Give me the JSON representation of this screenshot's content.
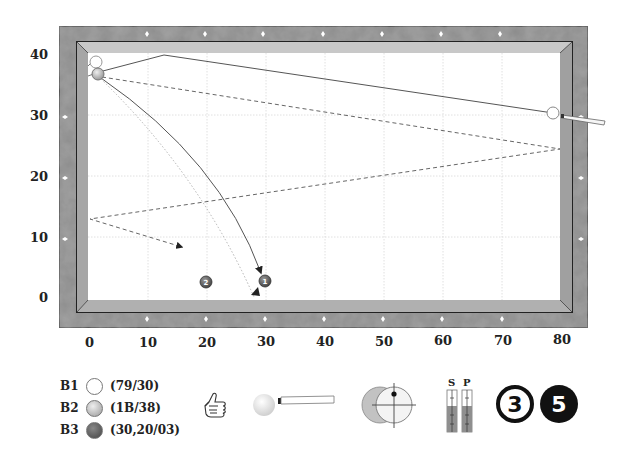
{
  "diagram": {
    "type": "billiards-carom-shot",
    "x_axis": {
      "ticks": [
        "0",
        "10",
        "20",
        "30",
        "40",
        "50",
        "60",
        "70",
        "80"
      ]
    },
    "y_axis": {
      "ticks": [
        "40",
        "30",
        "20",
        "10",
        "0"
      ]
    },
    "colors": {
      "rail": "#8a8a8a",
      "cushion": "#b9b9b9",
      "cloth": "#ffffff",
      "grid": "#d8d8d8",
      "line": "#555555"
    },
    "balls": [
      {
        "id": "B1",
        "label": "B1",
        "position": "(79/30)",
        "color": "#ffffff"
      },
      {
        "id": "B2",
        "label": "B2",
        "position": "(1B/38)",
        "color": "#c8c8c8"
      },
      {
        "id": "B3",
        "label": "B3",
        "position": "(30,20/03)",
        "color": "#6a6a6a"
      }
    ],
    "markers": [
      {
        "id": "marker-1",
        "text": "1"
      },
      {
        "id": "marker-2",
        "text": "2"
      }
    ]
  },
  "controls": {
    "thumb_icon": "thumbs-up-icon",
    "cue_icon": "cue-and-ball-icon",
    "aim_icon": "ball-hit-aim-icon",
    "gauge": {
      "s_label": "S",
      "p_label": "P"
    },
    "badge_outline": "3",
    "badge_filled": "5"
  }
}
